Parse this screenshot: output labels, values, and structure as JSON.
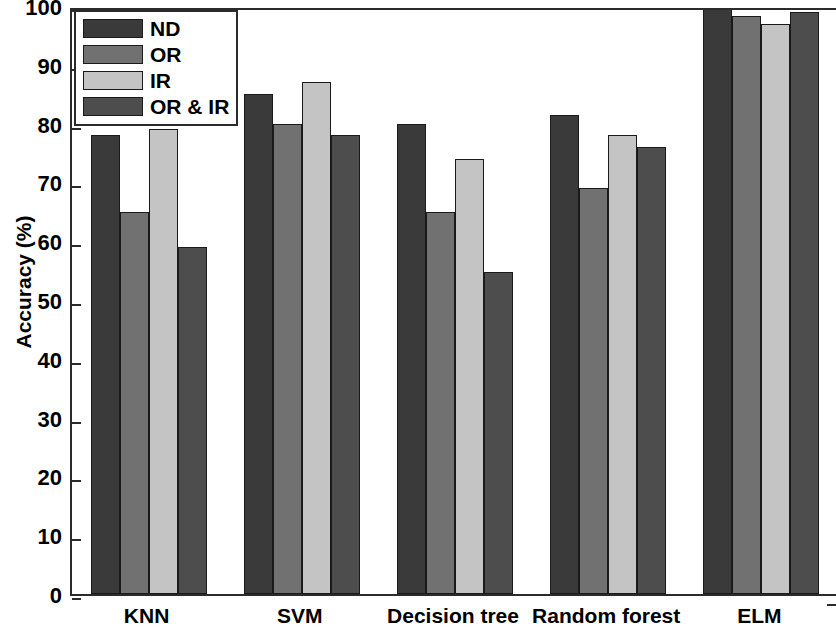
{
  "chart_data": {
    "type": "bar",
    "title": "",
    "xlabel": "",
    "ylabel": "Accuracy (%)",
    "ylim": [
      0,
      100
    ],
    "ytick_labels": [
      "100",
      "90",
      "80",
      "70",
      "60",
      "50",
      "40",
      "30",
      "20",
      "10",
      "0"
    ],
    "ytick_values": [
      100,
      90,
      80,
      70,
      60,
      50,
      40,
      30,
      20,
      10,
      0
    ],
    "grid": false,
    "legend_position": "upper left",
    "categories": [
      "KNN",
      "SVM",
      "Decision tree",
      "Random forest",
      "ELM"
    ],
    "series": [
      {
        "name": "ND",
        "color": "#3a3a3a",
        "values": [
          78,
          85,
          80,
          81.5,
          100
        ]
      },
      {
        "name": "OR",
        "color": "#717171",
        "values": [
          65,
          80,
          65,
          69,
          98.3
        ]
      },
      {
        "name": "IR",
        "color": "#c4c4c4",
        "values": [
          79,
          87,
          74,
          78,
          97
        ]
      },
      {
        "name": "OR & IR",
        "color": "#4d4d4d",
        "values": [
          59,
          78,
          54.8,
          76,
          99
        ]
      }
    ]
  },
  "legend": {
    "entries": [
      {
        "label": "ND",
        "color": "#3a3a3a"
      },
      {
        "label": "OR",
        "color": "#717171"
      },
      {
        "label": "IR",
        "color": "#c4c4c4"
      },
      {
        "label": "OR & IR",
        "color": "#4d4d4d"
      }
    ]
  },
  "axes": {
    "y_title": "Accuracy (%)",
    "y_min": 0,
    "y_max": 100,
    "y_ticks": [
      "100",
      "90",
      "80",
      "70",
      "60",
      "50",
      "40",
      "30",
      "20",
      "10",
      "0"
    ],
    "x_ticks": [
      "KNN",
      "SVM",
      "Decision tree",
      "Random forest",
      "ELM"
    ]
  }
}
